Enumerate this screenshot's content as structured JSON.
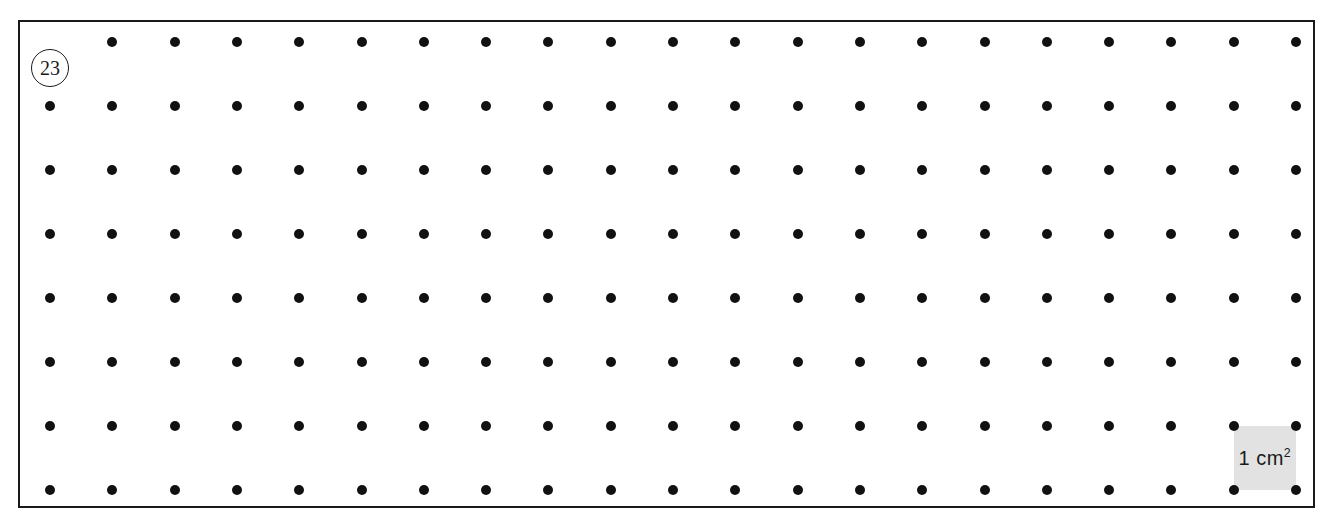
{
  "worksheet": {
    "problem_number": "23",
    "frame": {
      "left": 18,
      "top": 20,
      "width": 1297,
      "height": 488,
      "border_color": "#1a1a1a",
      "background_color": "#ffffff"
    }
  },
  "chart_data": {
    "type": "scatter",
    "title": "",
    "subtitle": "",
    "xlabel": "",
    "ylabel": "",
    "grid": true,
    "legend_position": "none",
    "columns": 21,
    "rows": 8,
    "x_start": 50,
    "y_start": 42,
    "x_spacing": 62.3,
    "y_spacing": 64,
    "dot_diameter": 10,
    "dot_color": "#111111",
    "total_dots": 168,
    "omitted_dot_positions": [
      [
        0,
        0
      ]
    ],
    "x": [
      50,
      112.3,
      174.6,
      236.9,
      299.2,
      361.5,
      423.8,
      486.1,
      548.4,
      610.7,
      673,
      735.3,
      797.6,
      859.9,
      922.2,
      984.5,
      1046.8,
      1109.1,
      1171.4,
      1233.7,
      1296
    ],
    "y": [
      42,
      106,
      170,
      234,
      298,
      362,
      426,
      490
    ]
  },
  "unit_square": {
    "label_text": "1 cm",
    "label_exponent": "2",
    "fill_color": "#e2e2e2",
    "col_start": 19,
    "col_end": 20,
    "row_start": 6,
    "row_end": 7,
    "left": 1233.7,
    "top": 426,
    "width": 62.3,
    "height": 64
  }
}
